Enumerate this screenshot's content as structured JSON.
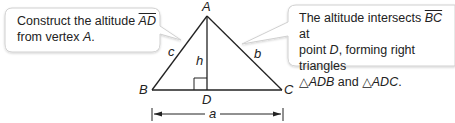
{
  "callouts": {
    "left": {
      "line1_prefix": "Construct the altitude ",
      "line1_segment": "AD",
      "line2_prefix": "from vertex ",
      "line2_vertex": "A",
      "line2_suffix": "."
    },
    "right": {
      "line1_prefix": "The altitude intersects ",
      "line1_segment": "BC",
      "line1_suffix": " at",
      "line2_prefix": "point ",
      "line2_point": "D",
      "line2_suffix": ", forming right triangles",
      "line3_tri1_symbol": "△",
      "line3_tri1": "ADB",
      "line3_and": " and ",
      "line3_tri2_symbol": "△",
      "line3_tri2": "ADC",
      "line3_suffix": "."
    }
  },
  "triangle": {
    "vertices": {
      "A": "A",
      "B": "B",
      "C": "C",
      "D": "D"
    },
    "sides": {
      "a": "a",
      "b": "b",
      "c": "c",
      "h": "h"
    }
  },
  "colors": {
    "stroke": "#222222",
    "callout_border": "#d0d0d0",
    "callout_fill": "#ffffff"
  }
}
